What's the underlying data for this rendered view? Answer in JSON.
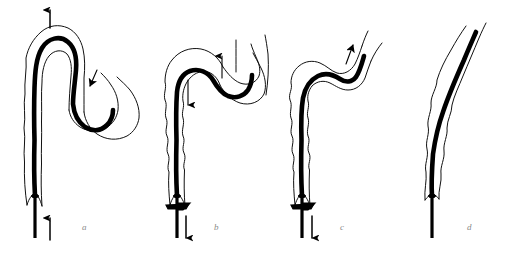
{
  "figure": {
    "type": "line-art-diagram",
    "background_color": "#ffffff",
    "ink_color": "#000000",
    "label_color": "#8a8a8a",
    "wall_stroke_color": "#111111",
    "panel_count": 4
  },
  "panels": [
    {
      "id": "a",
      "label": "a",
      "label_x": 82,
      "label_y": 223,
      "description": "catheter looped up through the organ with its tip redirected into the far limb",
      "arrows": [
        {
          "name": "tip-exit-arrow",
          "direction": "up",
          "label": "",
          "x": 50,
          "y": 16
        },
        {
          "name": "lumen-flow-arrow",
          "direction": "down-left",
          "label": "",
          "x": 93,
          "y": 80
        },
        {
          "name": "shaft-advance-arrow",
          "direction": "up",
          "label": "",
          "x": 50,
          "y": 228
        }
      ],
      "has_clamp_marker": false
    },
    {
      "id": "b",
      "label": "b",
      "label_x": 214,
      "label_y": 223,
      "description": "catheter tip drawn back, loop reduced, shaft withdrawn below the clamp",
      "arrows": [
        {
          "name": "lumen-flow-arrow",
          "direction": "up",
          "label": "",
          "x": 222,
          "y": 62
        },
        {
          "name": "tip-retract-arrow",
          "direction": "down",
          "label": "",
          "x": 188,
          "y": 92
        },
        {
          "name": "shaft-withdraw-arrow",
          "direction": "down",
          "label": "",
          "x": 186,
          "y": 228
        }
      ],
      "has_clamp_marker": true
    },
    {
      "id": "c",
      "label": "c",
      "label_x": 340,
      "label_y": 223,
      "description": "loop straightened, catheter follows a single smooth curve with the tip advanced distally",
      "arrows": [
        {
          "name": "tip-advance-arrow",
          "direction": "up-right",
          "label": "",
          "x": 350,
          "y": 52
        },
        {
          "name": "shaft-withdraw-arrow",
          "direction": "down",
          "label": "",
          "x": 312,
          "y": 228
        }
      ],
      "has_clamp_marker": true
    },
    {
      "id": "d",
      "label": "d",
      "label_x": 467,
      "label_y": 223,
      "description": "fully straightened catheter lying along the organ lumen, no residual loop",
      "arrows": [],
      "has_clamp_marker": false
    }
  ],
  "caption": {
    "visible": false,
    "text": ""
  }
}
